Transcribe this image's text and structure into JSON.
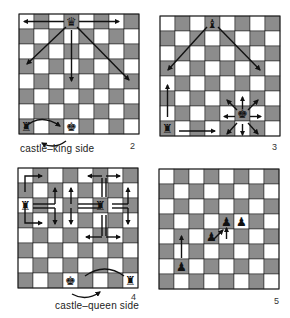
{
  "figures": [
    {
      "number": "2",
      "caption": "castle–king side",
      "description": "Queen moves in straight lines and diagonals; king castles king side with rook"
    },
    {
      "number": "3",
      "caption": "",
      "description": "Bishop diagonals, rook straight lines, king moves one square in any direction"
    },
    {
      "number": "4",
      "caption": "castle–queen side",
      "description": "Knight L-shaped moves; king castles queen side with rook"
    },
    {
      "number": "5",
      "caption": "",
      "description": "Pawn moves forward and captures diagonally"
    }
  ],
  "colors": {
    "light": "#ffffff",
    "dark": "#8c8c8c",
    "line": "#1a1a1a",
    "piece": "#111111"
  },
  "boards": [
    {
      "x": 19,
      "y": 14,
      "sq": 15,
      "pieces": [
        {
          "type": "queen",
          "c": 3,
          "r": 0
        },
        {
          "type": "rook",
          "c": 0,
          "r": 7
        },
        {
          "type": "king",
          "c": 3,
          "r": 7
        }
      ]
    },
    {
      "x": 160,
      "y": 16,
      "sq": 15,
      "pieces": [
        {
          "type": "bishop",
          "c": 3,
          "r": 0
        },
        {
          "type": "rook",
          "c": 0,
          "r": 7
        },
        {
          "type": "king",
          "c": 5,
          "r": 6
        }
      ]
    },
    {
      "x": 18,
      "y": 168,
      "sq": 15,
      "pieces": [
        {
          "type": "rook",
          "c": 0,
          "r": 2
        },
        {
          "type": "rook",
          "c": 5,
          "r": 2
        },
        {
          "type": "king",
          "c": 3,
          "r": 7
        },
        {
          "type": "rook",
          "c": 7,
          "r": 7
        }
      ]
    },
    {
      "x": 159,
      "y": 169,
      "sq": 15,
      "pieces": [
        {
          "type": "pawn",
          "c": 1,
          "r": 6
        },
        {
          "type": "pawn",
          "c": 3,
          "r": 4
        },
        {
          "type": "pawn",
          "c": 4,
          "r": 3
        },
        {
          "type": "pawn",
          "c": 5,
          "r": 3
        }
      ]
    }
  ]
}
